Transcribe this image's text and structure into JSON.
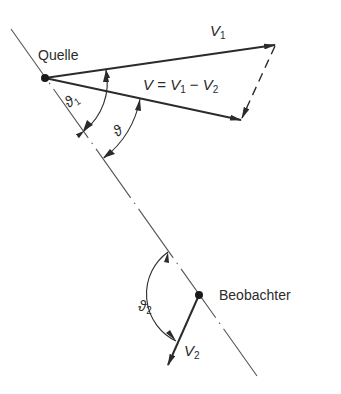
{
  "diagram": {
    "title": "",
    "colors": {
      "line": "#2b2b2b",
      "background": "#ffffff"
    },
    "points": {
      "quelle": {
        "label": "Quelle",
        "x": 45,
        "y": 78
      },
      "beobachter": {
        "label": "Beobachter",
        "x": 199,
        "y": 295
      }
    },
    "axis": {
      "style": "dash-dot",
      "from": [
        11,
        29
      ],
      "to": [
        257,
        376
      ]
    },
    "vectors": [
      {
        "name": "V1",
        "label_main": "V",
        "label_sub": "1",
        "from": [
          45,
          78
        ],
        "to": [
          275,
          45
        ]
      },
      {
        "name": "V",
        "label_text": "V = V1 − V2",
        "from": [
          45,
          78
        ],
        "to": [
          241,
          120
        ]
      },
      {
        "name": "V2",
        "label_main": "V",
        "label_sub": "2",
        "from": [
          199,
          295
        ],
        "to": [
          168,
          364
        ]
      },
      {
        "name": "minus-V2",
        "style": "dashed",
        "from": [
          275,
          45
        ],
        "to": [
          241,
          120
        ]
      }
    ],
    "angles": [
      {
        "name": "theta1",
        "label_main": "ϑ",
        "label_sub": "1",
        "center": "quelle",
        "radius": 62
      },
      {
        "name": "theta",
        "label_main": "ϑ",
        "label_sub": "",
        "center": "quelle",
        "radius": 98
      },
      {
        "name": "theta2",
        "label_main": "ϑ",
        "label_sub": "2",
        "center": "beobachter",
        "radius": 52
      }
    ],
    "labels": {
      "quelle": "Quelle",
      "beobachter": "Beobachter",
      "v1_main": "V",
      "v1_sub": "1",
      "eq_v": "V",
      "eq_eq": " = ",
      "eq_v1": "V",
      "eq_v1_sub": "1",
      "eq_minus": " − ",
      "eq_v2": "V",
      "eq_v2_sub": "2",
      "v2_main": "V",
      "v2_sub": "2",
      "theta1_main": "ϑ",
      "theta1_sub": "1",
      "theta_main": "ϑ",
      "theta2_main": "ϑ",
      "theta2_sub": "2"
    }
  }
}
